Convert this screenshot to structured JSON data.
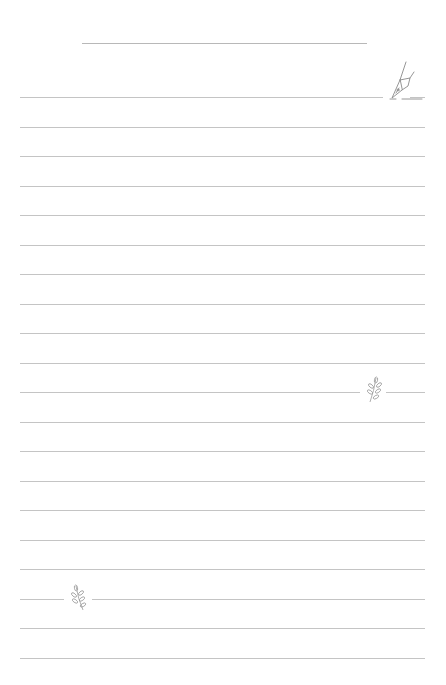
{
  "page": {
    "type": "lined-notepaper",
    "title_line": {
      "x1": 82,
      "x2": 367,
      "y": 43
    },
    "ruled_lines": {
      "count": 20,
      "x1": 20,
      "x2": 425,
      "first_y": 97,
      "spacing": 29.5
    },
    "line_color": "#c4c4c4",
    "decorations": [
      {
        "icon": "fountain-pen-icon",
        "x": 388,
        "y": 62,
        "row": 0
      },
      {
        "icon": "leaf-sprig-icon",
        "x": 364,
        "y": 378,
        "row": 10
      },
      {
        "icon": "leaf-sprig-icon",
        "x": 69,
        "y": 585,
        "row": 17
      }
    ]
  }
}
